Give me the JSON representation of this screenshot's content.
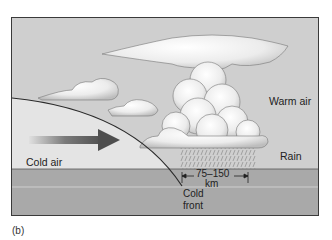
{
  "figure": {
    "caption": "(b)",
    "labels": {
      "cold_air": "Cold air",
      "warm_air": "Warm air",
      "rain": "Rain",
      "distance": "75–150",
      "distance_unit": "km",
      "cold_front_line1": "Cold",
      "cold_front_line2": "front"
    },
    "colors": {
      "sky": "#cfcfcf",
      "cold_air_mass": "#e6e6e6",
      "ground": "#a9a9a9",
      "arrow": "#555555",
      "cloud": "#f2f2f2",
      "front_line": "#2a2a2a"
    }
  }
}
